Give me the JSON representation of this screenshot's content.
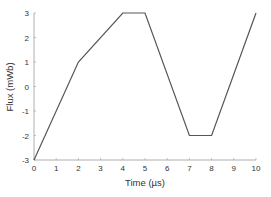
{
  "chart_data": {
    "type": "line",
    "title": "",
    "xlabel": "Time (µs)",
    "ylabel": "Flux (mWb)",
    "xlim": [
      0,
      10
    ],
    "ylim": [
      -3,
      3
    ],
    "xticks": [
      "0",
      "1",
      "2",
      "3",
      "4",
      "5",
      "6",
      "7",
      "8",
      "9",
      "10"
    ],
    "yticks": [
      "-3",
      "-2",
      "-1",
      "0",
      "1",
      "2",
      "3"
    ],
    "grid": false,
    "legend": null,
    "series": [
      {
        "name": "Flux",
        "x": [
          0,
          2,
          4,
          5,
          7,
          8,
          10
        ],
        "y": [
          -3,
          1,
          3,
          3,
          -2,
          -2,
          3
        ],
        "color": "#555555"
      }
    ]
  }
}
